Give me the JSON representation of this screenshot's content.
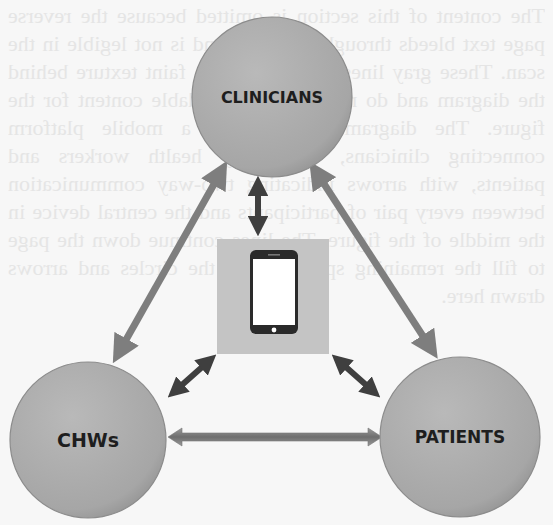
{
  "diagram": {
    "type": "network",
    "nodes": [
      {
        "id": "clinicians",
        "label": "CLINICIANS",
        "cx": 272,
        "cy": 97,
        "r": 80,
        "font_size": 16
      },
      {
        "id": "chws",
        "label": "CHWs",
        "cx": 88,
        "cy": 440,
        "r": 78,
        "font_size": 19
      },
      {
        "id": "patients",
        "label": "PATIENTS",
        "cx": 460,
        "cy": 437,
        "r": 80,
        "font_size": 17
      }
    ],
    "hub": {
      "id": "mobile-phone",
      "icon": "smartphone-icon",
      "x": 217,
      "y": 239,
      "w": 112,
      "h": 115
    },
    "edges": [
      {
        "from": "clinicians",
        "to": "chws",
        "style": "long-double-arrow"
      },
      {
        "from": "clinicians",
        "to": "patients",
        "style": "long-double-arrow"
      },
      {
        "from": "chws",
        "to": "patients",
        "style": "horizontal-double-arrow"
      },
      {
        "from": "mobile-phone",
        "to": "clinicians",
        "style": "short-dark-double-arrow"
      },
      {
        "from": "mobile-phone",
        "to": "chws",
        "style": "short-dark-double-arrow"
      },
      {
        "from": "mobile-phone",
        "to": "patients",
        "style": "short-dark-double-arrow"
      }
    ]
  },
  "colors": {
    "page_background": "#f7f7f7",
    "circle_fill": "#a8a8a8",
    "circle_highlight": "#b9b9b9",
    "circle_edge": "#8c8c8c",
    "hub_box": "#c4c4c4",
    "phone_body": "#2a2a2a",
    "phone_screen": "#ffffff",
    "long_arrow": "#7e7e7e",
    "short_arrow": "#3f3f3f",
    "label_text": "#1e1e1e"
  },
  "background_bleed_text": "bleed-through text from reverse side of page; not legible"
}
